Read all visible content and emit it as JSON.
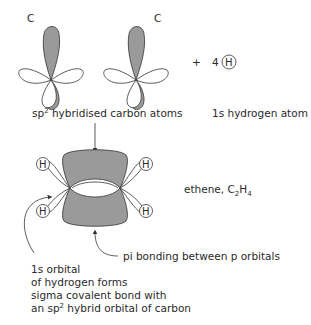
{
  "diagram": {
    "carbon_left_label": "C",
    "carbon_right_label": "C",
    "plus_sign": "+",
    "hydrogen_count": "4",
    "hydrogen_symbol": "H",
    "sp2_caption_prefix": "sp",
    "sp2_caption_sup": "2",
    "sp2_caption_suffix": " hybridised carbon atoms",
    "hydrogen_caption": "1s hydrogen atom",
    "ethene_label_prefix": "ethene, C",
    "ethene_sub1": "2",
    "ethene_mid": "H",
    "ethene_sub2": "4",
    "pi_label": "pi bonding between p orbitals",
    "sigma_note": {
      "line1": "1s orbital",
      "line2": "of hydrogen forms",
      "line3": "sigma covalent bond with",
      "line4_prefix": "an sp",
      "line4_sup": "2",
      "line4_suffix": " hybrid orbital of carbon"
    },
    "ethene_hydrogens": [
      "H",
      "H",
      "H",
      "H"
    ],
    "colors": {
      "shaded_lobe": "#9a9a9a",
      "outline": "#333333",
      "background": "#ffffff"
    }
  }
}
